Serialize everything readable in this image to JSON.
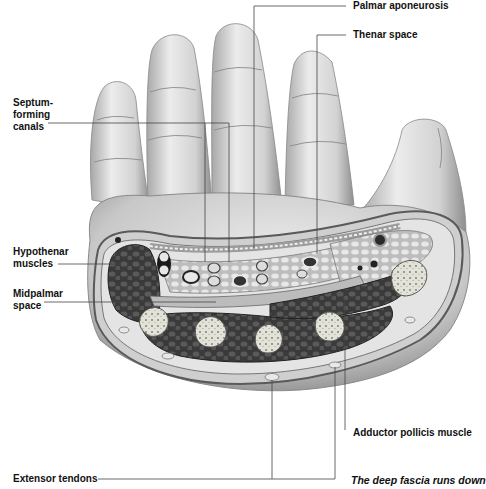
{
  "figure": {
    "labels": {
      "palmar_aponeurosis": "Palmar aponeurosis",
      "thenar_space": "Thenar space",
      "septum_forming_canals": "Septum-\nforming\ncanals",
      "hypothenar_muscles": "Hypothenar\nmuscles",
      "midpalmar_space": "Midpalmar\nspace",
      "adductor_pollicis_muscle": "Adductor pollicis muscle",
      "extensor_tendons": "Extensor tendons"
    },
    "caption": "The deep fascia runs down"
  },
  "colors": {
    "background": "#ffffff",
    "skin_light": "#e6e6e6",
    "skin_shade": "#9a9a9a",
    "muscle_dark": "#3c3c3c",
    "bone_light": "#dcdcd0",
    "leader_line": "#444444",
    "text": "#111111"
  }
}
